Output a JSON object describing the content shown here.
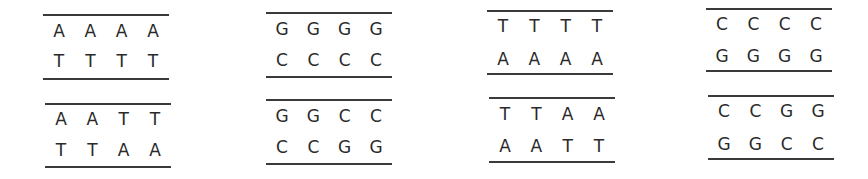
{
  "diagram": {
    "title": "",
    "groups": [
      {
        "panels": [
          {
            "top": [
              "A",
              "A",
              "A",
              "A"
            ],
            "bottom": [
              "T",
              "T",
              "T",
              "T"
            ]
          },
          {
            "top": [
              "A",
              "A",
              "T",
              "T"
            ],
            "bottom": [
              "T",
              "T",
              "A",
              "A"
            ]
          }
        ]
      },
      {
        "panels": [
          {
            "top": [
              "G",
              "G",
              "G",
              "G"
            ],
            "bottom": [
              "C",
              "C",
              "C",
              "C"
            ]
          },
          {
            "top": [
              "G",
              "G",
              "C",
              "C"
            ],
            "bottom": [
              "C",
              "C",
              "G",
              "G"
            ]
          }
        ]
      },
      {
        "panels": [
          {
            "top": [
              "T",
              "T",
              "T",
              "T"
            ],
            "bottom": [
              "A",
              "A",
              "A",
              "A"
            ]
          },
          {
            "top": [
              "T",
              "T",
              "A",
              "A"
            ],
            "bottom": [
              "A",
              "A",
              "T",
              "T"
            ]
          }
        ]
      },
      {
        "panels": [
          {
            "top": [
              "C",
              "C",
              "C",
              "C"
            ],
            "bottom": [
              "G",
              "G",
              "G",
              "G"
            ]
          },
          {
            "top": [
              "C",
              "C",
              "G",
              "G"
            ],
            "bottom": [
              "G",
              "G",
              "C",
              "C"
            ]
          }
        ]
      }
    ],
    "colors": {
      "text": "#2a2a2a",
      "rule": "#3a3a3a",
      "background": "#ffffff"
    }
  }
}
